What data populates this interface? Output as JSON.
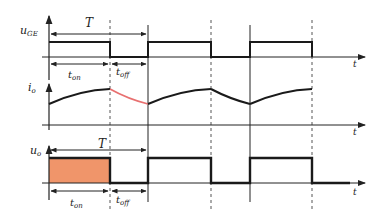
{
  "diagram": {
    "type": "timing-waveform",
    "panels": [
      {
        "id": "gate",
        "ylabel": "u",
        "ylabel_sub": "GE",
        "xlabel": "t"
      },
      {
        "id": "current",
        "ylabel": "i",
        "ylabel_sub": "o",
        "xlabel": "t"
      },
      {
        "id": "output",
        "ylabel": "u",
        "ylabel_sub": "o",
        "xlabel": "t"
      }
    ],
    "period_label": "T",
    "t_on": {
      "main": "t",
      "sub": "on"
    },
    "t_off": {
      "main": "t",
      "sub": "off"
    },
    "colors": {
      "line": "#1a1a1a",
      "fill": "#f0956a",
      "decay_curve": "#e87070",
      "axis": "#333333"
    }
  }
}
